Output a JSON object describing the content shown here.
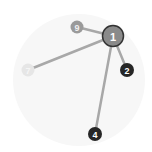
{
  "diagram": {
    "background_circle": {
      "cx": 79,
      "cy": 80,
      "r": 66,
      "fill": "#f7f7f7"
    },
    "edges": [
      {
        "from": "1",
        "to": "9"
      },
      {
        "from": "1",
        "to": "2"
      },
      {
        "from": "1",
        "to": "7"
      },
      {
        "from": "1",
        "to": "4"
      }
    ],
    "nodes": [
      {
        "id": "9",
        "label": "9",
        "x": 77,
        "y": 27,
        "r": 6.5,
        "fill": "#9a9a9a",
        "text": "#f0f0f0",
        "stroke": "none"
      },
      {
        "id": "7",
        "label": "7",
        "x": 28,
        "y": 70,
        "r": 6.5,
        "fill": "#e6e6e6",
        "text": "#f5f5f5",
        "stroke": "none"
      },
      {
        "id": "2",
        "label": "2",
        "x": 127,
        "y": 70,
        "r": 7,
        "fill": "#262626",
        "text": "#ffffff",
        "stroke": "none"
      },
      {
        "id": "4",
        "label": "4",
        "x": 95,
        "y": 134,
        "r": 7,
        "fill": "#262626",
        "text": "#ffffff",
        "stroke": "none"
      },
      {
        "id": "1",
        "label": "1",
        "x": 113,
        "y": 36,
        "r": 10.5,
        "fill": "#8a8a8a",
        "text": "#ffffff",
        "stroke": "#333333"
      }
    ]
  }
}
